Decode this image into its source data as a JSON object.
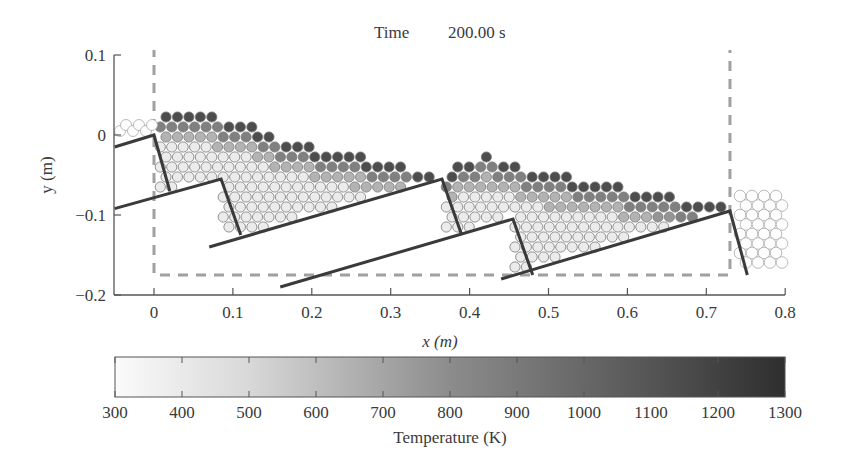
{
  "title": {
    "label": "Time",
    "value": "200.00 s"
  },
  "chart_data": [
    {
      "type": "scatter",
      "title": "Time 200.00 s",
      "description": "DEM particle simulation of a packed bed on a stepped (reciprocating) grate, particles shaded by temperature",
      "xlabel": "x (m)",
      "ylabel": "y (m)",
      "xlim": [
        -0.05,
        0.8
      ],
      "ylim": [
        -0.2,
        0.1
      ],
      "xticks": [
        0,
        0.1,
        0.2,
        0.3,
        0.4,
        0.5,
        0.6,
        0.7,
        0.8
      ],
      "xtick_labels": [
        "0",
        "0.1",
        "0.2",
        "0.3",
        "0.4",
        "0.5",
        "0.6",
        "0.7",
        "0.8"
      ],
      "yticks": [
        0.1,
        0,
        -0.1,
        -0.2
      ],
      "ytick_labels": [
        "0.1",
        "0",
        "−0.1",
        "−0.2"
      ],
      "grid": false,
      "domain_box": {
        "x": [
          0,
          0.73
        ],
        "y": [
          -0.175,
          0.1
        ],
        "style": "dashed",
        "color": "#a0a0a0"
      },
      "grate_segments": [
        {
          "name": "inlet-plate",
          "points": [
            [
              -0.05,
              -0.015
            ],
            [
              0.0,
              0.0
            ],
            [
              0.02,
              -0.07
            ]
          ]
        },
        {
          "name": "grate-1",
          "points": [
            [
              -0.05,
              -0.092
            ],
            [
              0.085,
              -0.055
            ],
            [
              0.11,
              -0.125
            ]
          ]
        },
        {
          "name": "grate-2",
          "points": [
            [
              0.07,
              -0.14
            ],
            [
              0.365,
              -0.055
            ],
            [
              0.39,
              -0.125
            ]
          ]
        },
        {
          "name": "grate-3",
          "points": [
            [
              0.16,
              -0.19
            ],
            [
              0.455,
              -0.105
            ],
            [
              0.48,
              -0.175
            ]
          ]
        },
        {
          "name": "grate-4",
          "points": [
            [
              0.44,
              -0.18
            ],
            [
              0.73,
              -0.095
            ],
            [
              0.752,
              -0.175
            ]
          ]
        }
      ],
      "bed_surface_profile": {
        "x": [
          0.0,
          0.05,
          0.1,
          0.15,
          0.2,
          0.25,
          0.3,
          0.35,
          0.37,
          0.4,
          0.42,
          0.45,
          0.5,
          0.55,
          0.6,
          0.65,
          0.7,
          0.73
        ],
        "y": [
          0.025,
          0.028,
          0.02,
          0.0,
          -0.015,
          -0.025,
          -0.035,
          -0.045,
          -0.05,
          -0.03,
          -0.025,
          -0.035,
          -0.05,
          -0.055,
          -0.065,
          -0.075,
          -0.085,
          -0.09
        ]
      },
      "observations": "Surface layer of particles is hottest (dark, ~1100-1300 K); interior particles near grate are cool (light, ~300-500 K). Fresh cool particles at inlet (x<0) and discharged particles beyond x=0.73."
    },
    {
      "type": "heatmap",
      "subtype": "colorbar",
      "xlabel": "Temperature (K)",
      "range": [
        300,
        1300
      ],
      "ticks": [
        300,
        400,
        500,
        600,
        700,
        800,
        900,
        1000,
        1100,
        1200,
        1300
      ],
      "tick_labels": [
        "300",
        "400",
        "500",
        "600",
        "700",
        "800",
        "900",
        "1000",
        "1100",
        "1200",
        "1300"
      ],
      "colormap": {
        "low": "#fbfbfb",
        "high": "#2e2e2e"
      }
    }
  ]
}
